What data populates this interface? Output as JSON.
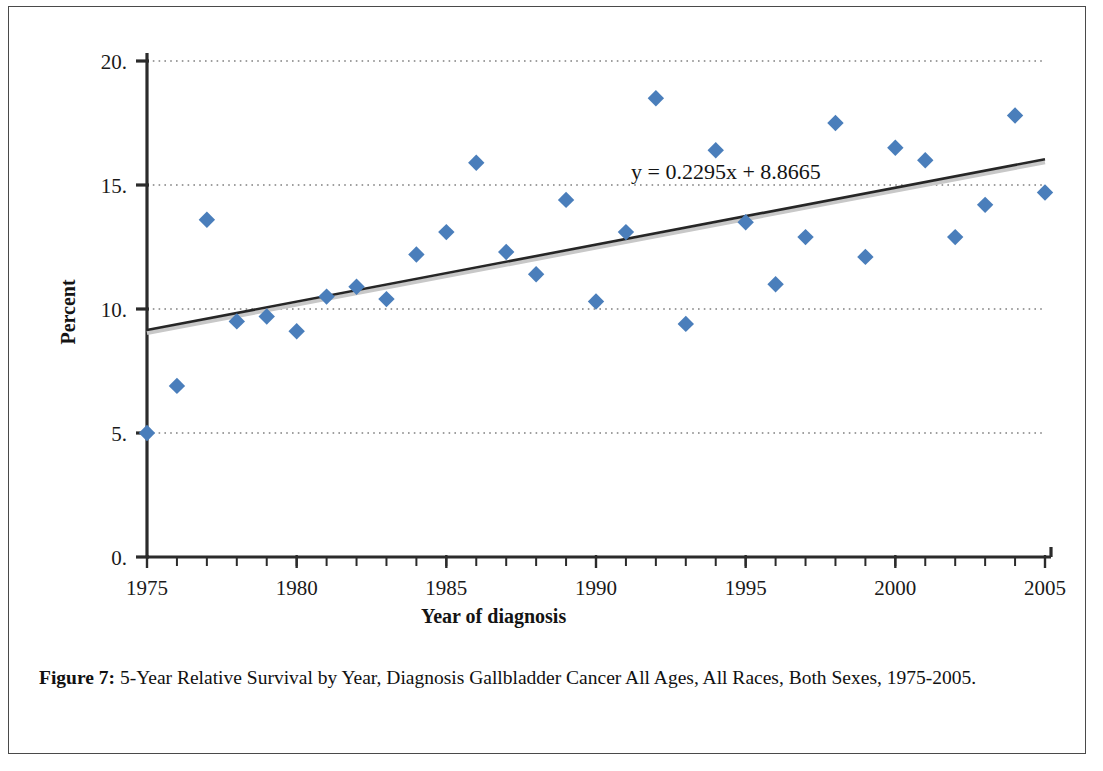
{
  "figure": {
    "caption_label": "Figure 7:",
    "caption_text": " 5-Year Relative Survival by Year, Diagnosis Gallbladder Cancer All Ages, All Races, Both Sexes, 1975-2005."
  },
  "colors": {
    "marker": "#4a7ebb",
    "trendline": "#262626",
    "axis": "#2b2b2b",
    "gridline": "#808080",
    "text": "#141414",
    "frame": "#4a4a4a"
  },
  "chart_data": {
    "type": "scatter",
    "title": "",
    "xlabel": "Year of diagnosis",
    "ylabel": "Percent",
    "xlim": [
      1975,
      2005
    ],
    "ylim": [
      0,
      20
    ],
    "xticks": [
      1975,
      1980,
      1985,
      1990,
      1995,
      2000,
      2005
    ],
    "xtick_labels": [
      "1975",
      "1980",
      "1985",
      "1990",
      "1995",
      "2000",
      "2005"
    ],
    "yticks": [
      0,
      5,
      10,
      15,
      20
    ],
    "ytick_labels": [
      "0.",
      "5.",
      "10.",
      "15.",
      "20."
    ],
    "minor_xtick_interval": 1,
    "grid": "horizontal-dotted",
    "legend": "none",
    "x": [
      1975,
      1976,
      1977,
      1978,
      1979,
      1980,
      1981,
      1982,
      1983,
      1984,
      1985,
      1986,
      1987,
      1988,
      1989,
      1990,
      1991,
      1992,
      1993,
      1994,
      1995,
      1996,
      1997,
      1998,
      1999,
      2000,
      2001,
      2002,
      2003,
      2004,
      2005
    ],
    "y": [
      5.0,
      6.9,
      13.6,
      9.5,
      9.7,
      9.1,
      10.5,
      10.9,
      10.4,
      12.2,
      13.1,
      15.9,
      12.3,
      11.4,
      14.4,
      10.3,
      13.1,
      18.5,
      9.4,
      16.4,
      13.5,
      11.0,
      12.9,
      17.5,
      12.1,
      16.5,
      16.0,
      12.9,
      14.2,
      17.8,
      14.7
    ],
    "series_name": "5-Year Relative Survival",
    "marker_shape": "diamond",
    "trendline": {
      "type": "linear",
      "equation": "y = 0.2295x + 8.8665",
      "slope": 0.2295,
      "intercept": 8.8665,
      "x_start": 1975,
      "x_end": 2005,
      "y_start": 9.15,
      "y_end": 16.04
    }
  }
}
